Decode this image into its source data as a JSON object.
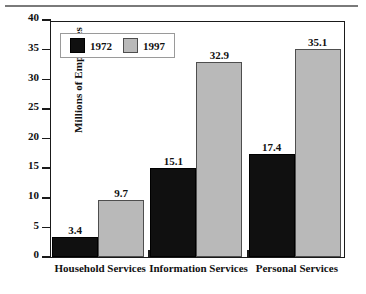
{
  "chart_data": {
    "type": "bar",
    "title": "",
    "xlabel": "",
    "ylabel": "Millions of Employees",
    "ylim": [
      0,
      40
    ],
    "yticks": [
      "0",
      "5",
      "10",
      "15",
      "20",
      "25",
      "30",
      "35",
      "40"
    ],
    "ytick_values": [
      0,
      5,
      10,
      15,
      20,
      25,
      30,
      35,
      40
    ],
    "grid": false,
    "legend_position": "upper-left-inside",
    "categories": [
      "Household Services",
      "Information Services",
      "Personal Services"
    ],
    "series": [
      {
        "name": "1972",
        "color": "#101010",
        "values": [
          3.4,
          9.7,
          17.4
        ],
        "labels": [
          "3.4",
          "15.1",
          "17.4"
        ]
      },
      {
        "name": "1997",
        "color": "#b9b9b9",
        "values": [
          9.7,
          32.9,
          35.1
        ],
        "labels": [
          "9.7",
          "32.9",
          "35.1"
        ]
      }
    ],
    "bars": [
      {
        "category": "Household Services",
        "series": "1972",
        "value": 3.4,
        "label": "3.4"
      },
      {
        "category": "Household Services",
        "series": "1997",
        "value": 9.7,
        "label": "9.7"
      },
      {
        "category": "Information Services",
        "series": "1972",
        "value": 15.1,
        "label": "15.1"
      },
      {
        "category": "Information Services",
        "series": "1997",
        "value": 32.9,
        "label": "32.9"
      },
      {
        "category": "Personal Services",
        "series": "1972",
        "value": 17.4,
        "label": "17.4"
      },
      {
        "category": "Personal Services",
        "series": "1997",
        "value": 35.1,
        "label": "35.1"
      }
    ]
  },
  "legend": {
    "items": [
      {
        "label": "1972",
        "color": "#101010"
      },
      {
        "label": "1997",
        "color": "#b9b9b9"
      }
    ]
  },
  "axis": {
    "y_title": "Millions of Employees"
  }
}
